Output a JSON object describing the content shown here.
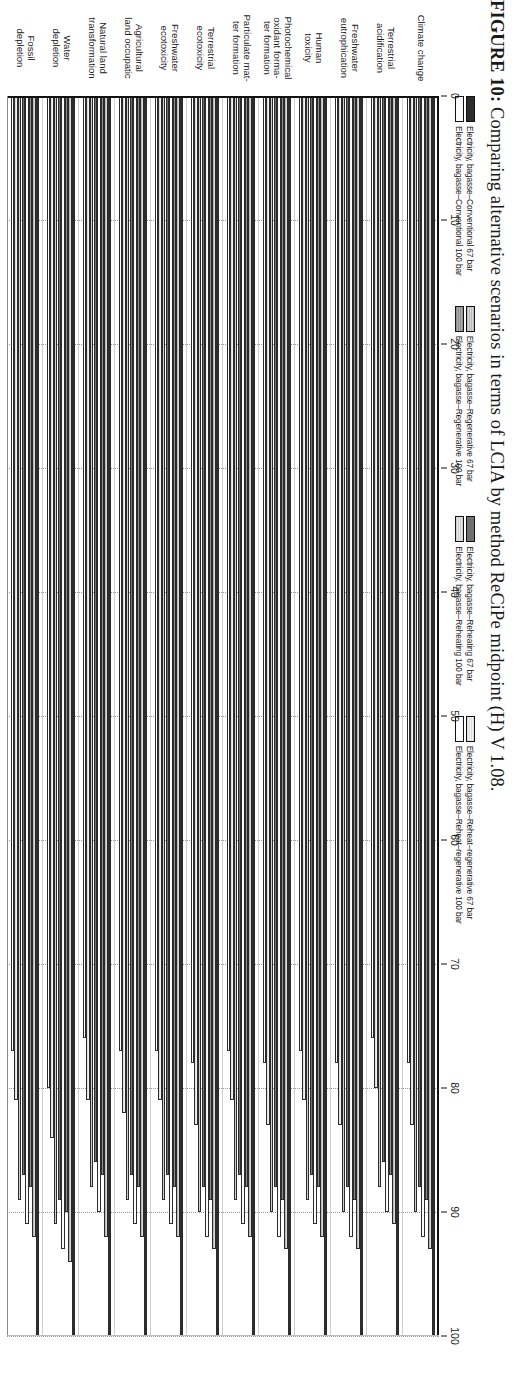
{
  "caption": {
    "prefix": "FIGURE 10:",
    "text": " Comparing alternative scenarios in terms of LCIA by method ReCiPe midpoint (H) V 1.08."
  },
  "legend": {
    "groups": [
      {
        "swatches": [
          "s0",
          "s3"
        ],
        "labels": [
          "Electricity, bagasse–Conventional 67 bar",
          "Electricity, bagasse–Conventional 100 bar"
        ]
      },
      {
        "swatches": [
          "s1",
          "s2"
        ],
        "labels": [
          "Electricity, bagasse–Regenerative 67 bar",
          "Electricity, bagasse–Regenerative 100 bar"
        ]
      },
      {
        "swatches": [
          "s4",
          "s5"
        ],
        "labels": [
          "Electricity, bagasse–Reheating 67 bar",
          "Electricity, bagasse–Reheating 100 bar"
        ]
      },
      {
        "swatches": [
          "s6",
          "s7"
        ],
        "labels": [
          "Electricity, bagasse–Reheat–regenerative 67 bar",
          "Electricity, bagasse–Reheat–regenerative 100 bar"
        ]
      }
    ]
  },
  "chart_data": {
    "type": "bar",
    "orientation": "horizontal",
    "title": "",
    "xlabel": "",
    "ylabel": "",
    "xlim": [
      0,
      100
    ],
    "xticks": [
      0,
      10,
      20,
      30,
      40,
      50,
      60,
      70,
      80,
      90,
      100
    ],
    "grid": true,
    "legend_position": "top",
    "categories": [
      "Climate change",
      "Terrestrial acidification",
      "Freshwater eutrophication",
      "Human toxicity",
      "Photochemical oxidant formation",
      "Particulate matter formation",
      "Terrestrial ecotoxicity",
      "Freshwater ecotoxicity",
      "Agricultural land occupation",
      "Natural land transformation",
      "Water depletion",
      "Fossil depletion"
    ],
    "category_lines": [
      [
        "Climate change"
      ],
      [
        "Terrestrial",
        "acidification"
      ],
      [
        "Freshwater",
        "eutrophication"
      ],
      [
        "Human",
        "toxicity"
      ],
      [
        "Photochemical",
        "oxidant forma-",
        "ter formation"
      ],
      [
        "Particulate mat-",
        "ter formation"
      ],
      [
        "Terrestrial",
        "ecotoxicity"
      ],
      [
        "Freshwater",
        "ecotoxicity"
      ],
      [
        "Agricultural",
        "land occupatic"
      ],
      [
        "Natural land",
        "transformation"
      ],
      [
        "Water",
        "depletion"
      ],
      [
        "Fossil",
        "depletion"
      ]
    ],
    "series": [
      {
        "name": "Electricity, bagasse–Conventional 67 bar",
        "style": "s0",
        "values": [
          100,
          100,
          100,
          100,
          100,
          100,
          100,
          100,
          100,
          100,
          100,
          100
        ]
      },
      {
        "name": "Electricity, bagasse–Regenerative 67 bar",
        "style": "s1",
        "values": [
          93,
          91,
          93,
          92,
          93,
          92,
          93,
          92,
          92,
          92,
          94,
          92
        ]
      },
      {
        "name": "Electricity, bagasse–Reheating 67 bar",
        "style": "s2",
        "values": [
          89,
          87,
          89,
          88,
          89,
          88,
          89,
          88,
          88,
          87,
          90,
          88
        ]
      },
      {
        "name": "Electricity, bagasse–Reheat–regenerative 67 bar",
        "style": "s3",
        "values": [
          92,
          90,
          92,
          91,
          92,
          91,
          92,
          91,
          91,
          90,
          93,
          91
        ]
      },
      {
        "name": "Electricity, bagasse–Conventional 100 bar",
        "style": "s4",
        "values": [
          88,
          86,
          88,
          87,
          88,
          87,
          88,
          87,
          87,
          86,
          89,
          87
        ]
      },
      {
        "name": "Electricity, bagasse–Regenerative 100 bar",
        "style": "s5",
        "values": [
          90,
          88,
          90,
          89,
          90,
          89,
          90,
          89,
          89,
          88,
          91,
          89
        ]
      },
      {
        "name": "Electricity, bagasse–Reheating 100 bar",
        "style": "s6",
        "values": [
          83,
          80,
          83,
          81,
          83,
          81,
          83,
          81,
          82,
          81,
          84,
          81
        ]
      },
      {
        "name": "Electricity, bagasse–Reheat–regenerative 100 bar",
        "style": "s7",
        "values": [
          78,
          76,
          78,
          77,
          78,
          77,
          78,
          77,
          77,
          76,
          80,
          77
        ]
      }
    ]
  }
}
